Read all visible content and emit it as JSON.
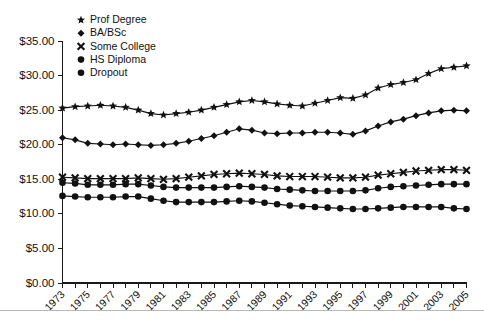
{
  "chart_data": {
    "type": "line",
    "title": "",
    "subtitle": "",
    "xlabel": "",
    "ylabel": "",
    "xlim": [
      1973,
      2005
    ],
    "ylim": [
      0,
      35
    ],
    "ytick_step": 5,
    "grid": false,
    "legend_position": "top-left",
    "y_tick_labels": [
      "$0.00",
      "$5.00",
      "$10.00",
      "$15.00",
      "$20.00",
      "$25.00",
      "$30.00",
      "$35.00"
    ],
    "y_tick_values": [
      0,
      5,
      10,
      15,
      20,
      25,
      30,
      35
    ],
    "x": [
      1973,
      1974,
      1975,
      1976,
      1977,
      1978,
      1979,
      1980,
      1981,
      1982,
      1983,
      1984,
      1985,
      1986,
      1987,
      1988,
      1989,
      1990,
      1991,
      1992,
      1993,
      1994,
      1995,
      1996,
      1997,
      1998,
      1999,
      2000,
      2001,
      2002,
      2003,
      2004,
      2005
    ],
    "x_tick_labels": [
      "1973",
      "1975",
      "1977",
      "1979",
      "1981",
      "1983",
      "1985",
      "1987",
      "1989",
      "1991",
      "1993",
      "1995",
      "1997",
      "1999",
      "2001",
      "2003",
      "2005"
    ],
    "x_tick_values": [
      1973,
      1975,
      1977,
      1979,
      1981,
      1983,
      1985,
      1987,
      1989,
      1991,
      1993,
      1995,
      1997,
      1999,
      2001,
      2003,
      2005
    ],
    "series": [
      {
        "name": "Prof Degree",
        "marker": "star",
        "color": "#111111",
        "values": [
          25.3,
          25.5,
          25.6,
          25.7,
          25.6,
          25.4,
          25.0,
          24.5,
          24.3,
          24.5,
          24.7,
          25.0,
          25.4,
          25.8,
          26.2,
          26.4,
          26.2,
          25.9,
          25.7,
          25.6,
          26.0,
          26.4,
          26.8,
          26.7,
          27.2,
          28.2,
          28.7,
          29.0,
          29.4,
          30.3,
          31.0,
          31.2,
          31.4
        ]
      },
      {
        "name": "BA/BSc",
        "marker": "diamond",
        "color": "#111111",
        "values": [
          21.0,
          20.7,
          20.2,
          20.1,
          20.0,
          20.1,
          20.0,
          19.9,
          20.0,
          20.2,
          20.5,
          20.9,
          21.3,
          21.8,
          22.3,
          22.1,
          21.7,
          21.6,
          21.7,
          21.7,
          21.8,
          21.8,
          21.7,
          21.5,
          22.0,
          22.7,
          23.3,
          23.7,
          24.2,
          24.6,
          24.9,
          25.0,
          24.9
        ]
      },
      {
        "name": "Some College",
        "marker": "cross",
        "color": "#111111",
        "values": [
          15.3,
          15.2,
          15.1,
          15.1,
          15.1,
          15.1,
          15.2,
          15.1,
          15.0,
          15.1,
          15.3,
          15.5,
          15.7,
          15.8,
          15.9,
          15.8,
          15.7,
          15.5,
          15.4,
          15.4,
          15.4,
          15.3,
          15.2,
          15.2,
          15.3,
          15.6,
          15.8,
          16.0,
          16.2,
          16.3,
          16.4,
          16.4,
          16.3
        ]
      },
      {
        "name": "HS Diploma",
        "marker": "circle",
        "color": "#111111",
        "values": [
          14.5,
          14.4,
          14.2,
          14.2,
          14.2,
          14.3,
          14.3,
          14.1,
          13.9,
          13.8,
          13.8,
          13.8,
          13.8,
          13.9,
          14.0,
          13.9,
          13.8,
          13.6,
          13.5,
          13.4,
          13.3,
          13.3,
          13.3,
          13.3,
          13.4,
          13.7,
          13.9,
          14.0,
          14.1,
          14.2,
          14.3,
          14.3,
          14.3
        ]
      },
      {
        "name": "Dropout",
        "marker": "circle",
        "color": "#111111",
        "values": [
          12.6,
          12.5,
          12.4,
          12.4,
          12.4,
          12.5,
          12.5,
          12.2,
          11.9,
          11.7,
          11.7,
          11.7,
          11.7,
          11.8,
          11.9,
          11.8,
          11.6,
          11.4,
          11.2,
          11.1,
          11.0,
          10.9,
          10.8,
          10.7,
          10.7,
          10.8,
          10.9,
          11.0,
          11.0,
          11.0,
          11.0,
          10.8,
          10.7
        ]
      }
    ]
  },
  "legend": {
    "items": [
      {
        "label": "Prof Degree",
        "marker": "star"
      },
      {
        "label": "BA/BSc",
        "marker": "diamond"
      },
      {
        "label": "Some College",
        "marker": "cross"
      },
      {
        "label": "HS Diploma",
        "marker": "circle"
      },
      {
        "label": "Dropout",
        "marker": "circle"
      }
    ]
  }
}
